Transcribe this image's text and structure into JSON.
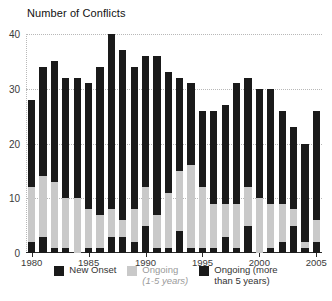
{
  "chart_data": {
    "type": "bar",
    "subtype": "stacked-bar",
    "title": "Number of Conflicts",
    "xlabel": "",
    "ylabel": "",
    "ylim": [
      0,
      40
    ],
    "yticks": [
      0,
      10,
      20,
      30,
      40
    ],
    "ytick_labels": [
      "0",
      "10",
      "20",
      "30",
      "40"
    ],
    "xticks": [
      1980,
      1985,
      1990,
      1995,
      2000,
      2005
    ],
    "xtick_labels": [
      "1980",
      "1985",
      "1990",
      "1995",
      "2000",
      "2005"
    ],
    "grid": "horizontal dotted gridlines at 10, 20, 30, 40",
    "legend_position": "bottom-center",
    "categories": [
      1980,
      1981,
      1982,
      1983,
      1984,
      1985,
      1986,
      1987,
      1988,
      1989,
      1990,
      1991,
      1992,
      1993,
      1994,
      1995,
      1996,
      1997,
      1998,
      1999,
      2000,
      2001,
      2002,
      2003,
      2004,
      2005
    ],
    "series": [
      {
        "name": "New Onset",
        "color": "#1a1a1a",
        "values": [
          2,
          3,
          1,
          1,
          0,
          1,
          1,
          3,
          3,
          2,
          5,
          1,
          1,
          4,
          1,
          1,
          1,
          3,
          1,
          5,
          0,
          1,
          2,
          5,
          1,
          2
        ]
      },
      {
        "name": "Ongoing (1-5 years)",
        "color": "#c9c9c9",
        "values": [
          10,
          11,
          12,
          9,
          10,
          7,
          6,
          5,
          3,
          6,
          7,
          6,
          10,
          11,
          15,
          11,
          8,
          6,
          8,
          7,
          10,
          8,
          7,
          3,
          1,
          4
        ]
      },
      {
        "name": "Ongoing (more than 5 years)",
        "color": "#1a1a1a",
        "values": [
          16,
          20,
          22,
          22,
          22,
          23,
          27,
          32,
          31,
          26,
          24,
          29,
          22,
          17,
          15,
          14,
          17,
          18,
          22,
          20,
          20,
          21,
          17,
          15,
          18,
          20
        ]
      }
    ],
    "totals": [
      28,
      34,
      35,
      32,
      32,
      31,
      34,
      40,
      37,
      34,
      36,
      36,
      33,
      32,
      31,
      26,
      26,
      27,
      31,
      32,
      30,
      30,
      26,
      23,
      20,
      26
    ]
  },
  "legend": {
    "items": [
      {
        "label": "New Onset",
        "label_line2": "",
        "swatch": "sw-onset",
        "muted": false
      },
      {
        "label": "Ongoing",
        "label_line2": "(1-5 years)",
        "swatch": "sw-1to5",
        "muted": true
      },
      {
        "label": "Ongoing (more",
        "label_line2": "than 5 years)",
        "swatch": "sw-5plus",
        "muted": false
      }
    ]
  },
  "colors": {
    "onset": "#1a1a1a",
    "ongoing_1_5": "#c9c9c9",
    "ongoing_5plus": "#1a1a1a",
    "grid": "#b8b8b8",
    "axis": "#2b2b2b",
    "text": "#333333"
  }
}
